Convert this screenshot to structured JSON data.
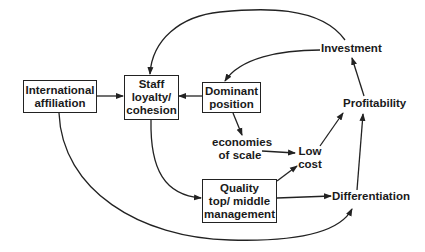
{
  "diagram": {
    "nodes": {
      "international": {
        "lines": [
          "International",
          "affiliation"
        ],
        "boxed": true
      },
      "staff": {
        "lines": [
          "Staff",
          "loyalty/",
          "cohesion"
        ],
        "boxed": true
      },
      "dominant": {
        "lines": [
          "Dominant",
          "position"
        ],
        "boxed": true
      },
      "quality": {
        "lines": [
          "Quality",
          "top/ middle",
          "management"
        ],
        "boxed": true
      },
      "investment": {
        "lines": [
          "Investment"
        ],
        "boxed": false
      },
      "profitability": {
        "lines": [
          "Profitability"
        ],
        "boxed": false
      },
      "economies": {
        "lines": [
          "economies",
          "of scale"
        ],
        "boxed": false
      },
      "lowcost": {
        "lines": [
          "Low",
          "cost"
        ],
        "boxed": false
      },
      "differentiation": {
        "lines": [
          "Differentiation"
        ],
        "boxed": false
      }
    },
    "edges": [
      {
        "from": "International affiliation",
        "to": "Staff loyalty/ cohesion"
      },
      {
        "from": "Dominant position",
        "to": "Staff loyalty/ cohesion"
      },
      {
        "from": "Investment",
        "to": "Staff loyalty/ cohesion"
      },
      {
        "from": "Investment",
        "to": "Dominant position"
      },
      {
        "from": "Dominant position",
        "to": "economies of scale"
      },
      {
        "from": "economies of scale",
        "to": "Low cost"
      },
      {
        "from": "Staff loyalty/ cohesion",
        "to": "Quality top/ middle management"
      },
      {
        "from": "Quality top/ middle management",
        "to": "Low cost"
      },
      {
        "from": "Quality top/ middle management",
        "to": "Differentiation"
      },
      {
        "from": "International affiliation",
        "to": "Differentiation"
      },
      {
        "from": "Low cost",
        "to": "Profitability"
      },
      {
        "from": "Differentiation",
        "to": "Profitability"
      },
      {
        "from": "Profitability",
        "to": "Investment"
      }
    ],
    "colors": {
      "stroke": "#222222",
      "text": "#1a1a1a",
      "background": "#ffffff"
    }
  }
}
